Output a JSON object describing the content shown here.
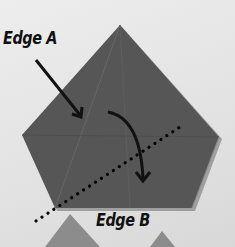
{
  "diagram": {
    "labels": {
      "edge_a": "Edge A",
      "edge_b": "Edge B"
    },
    "colors": {
      "paper": "#555555",
      "paper_dark": "#4a4a4a",
      "background": "#e6e6e6",
      "arrow": "#111111",
      "lower_shapes": "#8a8a8a"
    },
    "elements": {
      "pentagon": "folded paper model (pentagon)",
      "edge_a_arrow": "straight arrow pointing to Edge A",
      "fold_arrow": "curved arrow indicating fold direction",
      "fold_line": "dotted fold line"
    }
  }
}
